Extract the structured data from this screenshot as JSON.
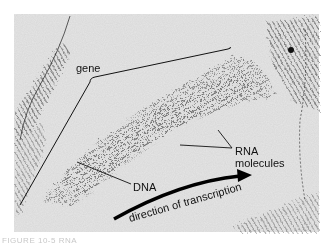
{
  "figure": {
    "type": "electron micrograph",
    "labels": {
      "gene": "gene",
      "rna": "RNA",
      "rna_line2": "molecules",
      "dna": "DNA",
      "arrow": "direction of transcription"
    },
    "colors": {
      "background": "#e4e4e4",
      "strand": "#555555",
      "ink": "#111111"
    }
  },
  "caption": "FIGURE 10-5 RNA"
}
